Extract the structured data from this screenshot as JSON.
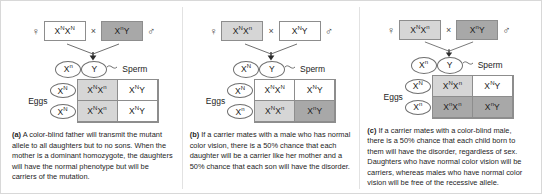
{
  "figure": {
    "symbols": {
      "female": "♀",
      "male": "♂",
      "cross": "×"
    },
    "labels": {
      "sperm": "Sperm",
      "eggs": "Eggs"
    },
    "colors": {
      "shade_light": "#d6d6d6",
      "shade_dark": "#a8a8a8",
      "box_border": "#8d8d8d",
      "text": "#1d1d1d"
    }
  },
  "panels": [
    {
      "id": "a",
      "mother": {
        "allele1": "X",
        "sup1": "N",
        "allele2": "X",
        "sup2": "N",
        "shade": "none"
      },
      "father": {
        "allele1": "X",
        "sup1": "n",
        "allele2": "Y",
        "sup2": "",
        "shade": "dark"
      },
      "sperm": [
        {
          "allele": "X",
          "sup": "n"
        },
        {
          "allele": "Y",
          "sup": ""
        }
      ],
      "eggs": [
        {
          "allele": "X",
          "sup": "N"
        },
        {
          "allele": "X",
          "sup": "N"
        }
      ],
      "cells": [
        {
          "text": "X N X n",
          "p1": "X",
          "s1": "N",
          "p2": "X",
          "s2": "n",
          "shade": "light"
        },
        {
          "text": "X N Y",
          "p1": "X",
          "s1": "N",
          "p2": "Y",
          "s2": "",
          "shade": "none"
        },
        {
          "text": "X N X n",
          "p1": "X",
          "s1": "N",
          "p2": "X",
          "s2": "n",
          "shade": "light"
        },
        {
          "text": "X N Y",
          "p1": "X",
          "s1": "N",
          "p2": "Y",
          "s2": "",
          "shade": "none"
        }
      ],
      "caption_label": "(a)",
      "caption_text": "A color-blind father will transmit the mutant allele to all daughters but to no sons. When the mother is a dominant homozygote, the daughters will have the normal phenotype but will be carriers of the mutation."
    },
    {
      "id": "b",
      "mother": {
        "allele1": "X",
        "sup1": "N",
        "allele2": "X",
        "sup2": "n",
        "shade": "light"
      },
      "father": {
        "allele1": "X",
        "sup1": "N",
        "allele2": "Y",
        "sup2": "",
        "shade": "none"
      },
      "sperm": [
        {
          "allele": "X",
          "sup": "N"
        },
        {
          "allele": "Y",
          "sup": ""
        }
      ],
      "eggs": [
        {
          "allele": "X",
          "sup": "N"
        },
        {
          "allele": "X",
          "sup": "n"
        }
      ],
      "cells": [
        {
          "text": "X N X N",
          "p1": "X",
          "s1": "N",
          "p2": "X",
          "s2": "N",
          "shade": "none"
        },
        {
          "text": "X N Y",
          "p1": "X",
          "s1": "N",
          "p2": "Y",
          "s2": "",
          "shade": "none"
        },
        {
          "text": "X N X n",
          "p1": "X",
          "s1": "N",
          "p2": "X",
          "s2": "n",
          "shade": "light"
        },
        {
          "text": "X n Y",
          "p1": "X",
          "s1": "n",
          "p2": "Y",
          "s2": "",
          "shade": "dark"
        }
      ],
      "caption_label": "(b)",
      "caption_text": "If a carrier mates with a male who has normal color vision, there is a 50% chance that each daughter will be a carrier like her mother and a 50% chance that each son will have the disorder."
    },
    {
      "id": "c",
      "mother": {
        "allele1": "X",
        "sup1": "N",
        "allele2": "X",
        "sup2": "n",
        "shade": "light"
      },
      "father": {
        "allele1": "X",
        "sup1": "n",
        "allele2": "Y",
        "sup2": "",
        "shade": "dark"
      },
      "sperm": [
        {
          "allele": "X",
          "sup": "n"
        },
        {
          "allele": "Y",
          "sup": ""
        }
      ],
      "eggs": [
        {
          "allele": "X",
          "sup": "N"
        },
        {
          "allele": "X",
          "sup": "n"
        }
      ],
      "cells": [
        {
          "text": "X N X n",
          "p1": "X",
          "s1": "N",
          "p2": "X",
          "s2": "n",
          "shade": "light"
        },
        {
          "text": "X N Y",
          "p1": "X",
          "s1": "N",
          "p2": "Y",
          "s2": "",
          "shade": "none"
        },
        {
          "text": "X n X n",
          "p1": "X",
          "s1": "n",
          "p2": "X",
          "s2": "n",
          "shade": "dark"
        },
        {
          "text": "X n Y",
          "p1": "X",
          "s1": "n",
          "p2": "Y",
          "s2": "",
          "shade": "dark"
        }
      ],
      "caption_label": "(c)",
      "caption_text": "If a carrier mates with a color-blind male, there is a 50% chance that each child born to them will have the disorder, regardless of sex. Daughters who have normal color vision will be carriers, whereas males who have normal color vision will be free of the recessive allele."
    }
  ]
}
